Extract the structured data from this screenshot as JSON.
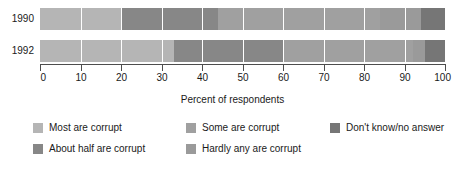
{
  "chart_data": {
    "type": "bar",
    "orientation": "horizontal",
    "stacked": true,
    "title": "",
    "xlabel": "Percent of respondents",
    "ylabel": "",
    "xlim": [
      0,
      100
    ],
    "xticks": [
      0,
      10,
      20,
      30,
      40,
      50,
      60,
      70,
      80,
      90,
      100
    ],
    "xticklabels": [
      "0",
      "10",
      "20",
      "30",
      "40",
      "50",
      "60",
      "70",
      "80",
      "90",
      "100"
    ],
    "grid": true,
    "legend_position": "bottom",
    "categories": [
      "1990",
      "1992"
    ],
    "series": [
      {
        "name": "Most are corrupt",
        "color": "#b5b5b5",
        "values": [
          20,
          33
        ]
      },
      {
        "name": "About half are corrupt",
        "color": "#878787",
        "values": [
          24,
          27
        ]
      },
      {
        "name": "Some are corrupt",
        "color": "#a0a0a0",
        "values": [
          40,
          32
        ]
      },
      {
        "name": "Hardly any are corrupt",
        "color": "#9a9a9a",
        "values": [
          10,
          3
        ]
      },
      {
        "name": "Don't know/no answer",
        "color": "#767676",
        "values": [
          6,
          5
        ]
      }
    ]
  },
  "legend": {
    "columns": [
      [
        {
          "label": "Most are corrupt",
          "color": "#b5b5b5"
        },
        {
          "label": "About half are corrupt",
          "color": "#878787"
        }
      ],
      [
        {
          "label": "Some are corrupt",
          "color": "#a0a0a0"
        },
        {
          "label": "Hardly any are corrupt",
          "color": "#9a9a9a"
        }
      ],
      [
        {
          "label": "Don't know/no answer",
          "color": "#767676"
        }
      ]
    ]
  }
}
